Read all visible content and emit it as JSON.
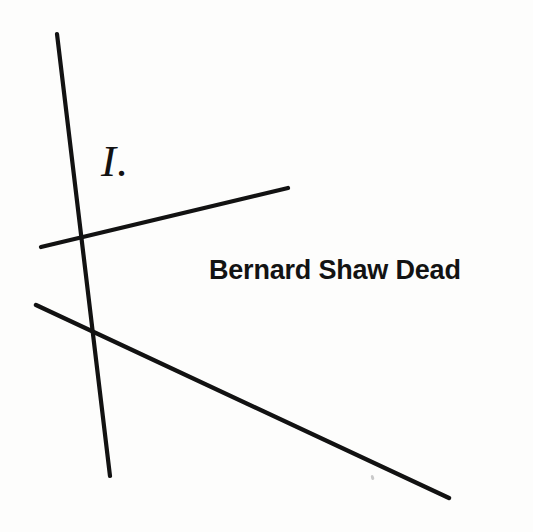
{
  "page": {
    "background_color": "#fdfdfc",
    "ink_color": "#121212",
    "width": 533,
    "height": 532
  },
  "figure": {
    "label": "I.",
    "caption": "Bernard Shaw Dead",
    "speck_artifact": true
  },
  "chart_data": {
    "type": "line",
    "title": "I.",
    "subtitle": "Bernard Shaw Dead",
    "xlabel": "",
    "ylabel": "",
    "grid": false,
    "legend": "none",
    "xlim": [
      0,
      533
    ],
    "ylim": [
      0,
      532
    ],
    "annotations": [
      {
        "text": "I.",
        "x": 101,
        "y": 139,
        "style": "italic-serif"
      },
      {
        "text": "Bernard Shaw Dead",
        "x": 209,
        "y": 256,
        "style": "bold-sans"
      }
    ],
    "intersection": {
      "x": 88,
      "y": 284
    },
    "series": [
      {
        "name": "steep-descending-line",
        "x": [
          57,
          110
        ],
        "y": [
          34,
          476
        ],
        "stroke_width": 4.2
      },
      {
        "name": "upper-right-ray",
        "x": [
          41,
          288
        ],
        "y": [
          247,
          188
        ],
        "stroke_width": 4.2
      },
      {
        "name": "lower-right-ray",
        "x": [
          36,
          449
        ],
        "y": [
          305,
          498
        ],
        "stroke_width": 4.4
      }
    ]
  }
}
